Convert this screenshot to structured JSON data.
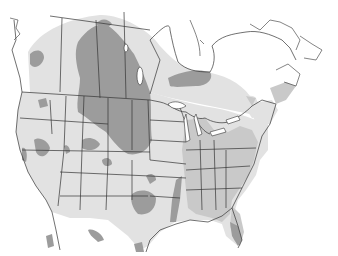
{
  "map": {
    "type": "range-map",
    "region": "North America (Canada, United States, northern Mexico)",
    "colors": {
      "background": "#ffffff",
      "land_unshaded": "#ffffff",
      "range_light": "#e2e2e2",
      "range_medium": "#c9c9c9",
      "range_dark": "#9c9c9c",
      "borders": "#333333"
    },
    "zones": [
      {
        "id": "light",
        "label": "Light range zone"
      },
      {
        "id": "medium",
        "label": "Medium range zone"
      },
      {
        "id": "dark",
        "label": "Dark range zone"
      }
    ]
  }
}
